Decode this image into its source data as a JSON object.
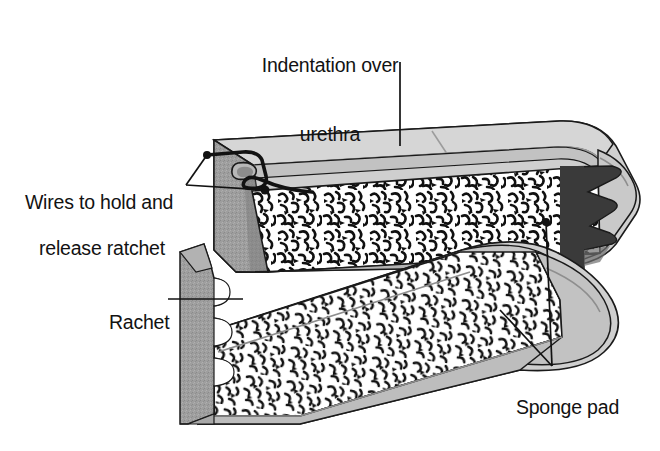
{
  "figure": {
    "background_color": "#ffffff",
    "width": 660,
    "height": 451
  },
  "labels": {
    "indentation": {
      "line1": "Indentation over",
      "line2": "urethra",
      "leader_from": [
        400,
        62
      ],
      "leader_to": [
        400,
        146
      ]
    },
    "wires": {
      "line1": "Wires to hold and",
      "line2": "release ratchet",
      "leader_points": [
        [
          207,
          155
        ],
        [
          265,
          190
        ]
      ]
    },
    "ratchet": {
      "line1": "Rachet",
      "leader_from": [
        168,
        299
      ],
      "leader_to": [
        243,
        299
      ]
    },
    "sponge": {
      "line1": "Sponge pad",
      "leader_points": [
        [
          546,
          222
        ],
        [
          500,
          310
        ]
      ],
      "leader_join": [
        552,
        366
      ]
    }
  },
  "colors": {
    "ink": "#121212",
    "outline": "#1a1a1a",
    "top_face": "#d6d6d6",
    "top_face_far": "#c9c9c9",
    "rim_light": "#c2c2c2",
    "end_cap": "#9a9a9a",
    "end_cap_dark": "#7e7e7e",
    "base_rail": "#b9b9b9",
    "base_rail_dark": "#a2a2a2",
    "ratchet_dark": "#3a3a3a",
    "ratchet_arm": "#9e9e9e",
    "sponge_fill": "#ffffff",
    "sponge_ink": "#101010",
    "shadow": "#8f8f8f"
  },
  "parts": {
    "upper_jaw": "Upper clamp arm with indented top face over the urethra",
    "lower_jaw": "Lower clamp arm with wavy contoured profile",
    "ratchet_teeth": "Dark ratchet teeth at right hinge",
    "ratchet_arm": "Vertical ratchet strip with scalloped notches at left",
    "sponge_pads": "Open-cell foam padding inside both jaws",
    "wires": "Bent wire loops at left end cap"
  }
}
